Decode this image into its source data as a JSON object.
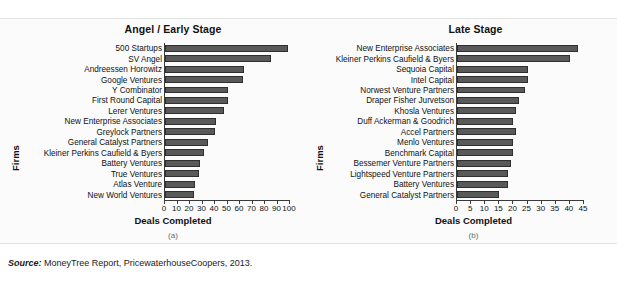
{
  "source": {
    "label": "Source:",
    "text": " MoneyTree Report, PricewaterhouseCoopers, 2013."
  },
  "colors": {
    "bar_fill": "#595959",
    "bar_border": "#2f2f2f",
    "panel_background": "#fbfbfb",
    "axis": "#3a3a3a",
    "text": "#111111"
  },
  "chart_data": [
    {
      "type": "bar",
      "orientation": "horizontal",
      "title": "Angel / Early Stage",
      "caption": "(a)",
      "xlabel": "Deals Completed",
      "ylabel": "Firms",
      "xlim": [
        0,
        100
      ],
      "xticks": [
        "0",
        "10",
        "20",
        "30",
        "40",
        "50",
        "60",
        "70",
        "80",
        "90",
        "100"
      ],
      "grid": false,
      "legend": "none",
      "categories": [
        "500 Startups",
        "SV Angel",
        "Andreessen Horowitz",
        "Google Ventures",
        "Y Combinator",
        "First Round Capital",
        "Lerer Ventures",
        "New Enterprise Associates",
        "Greylock Partners",
        "General Catalyst Partners",
        "Kleiner Perkins Caufield & Byers",
        "Battery Ventures",
        "True Ventures",
        "Atlas Venture",
        "New World Ventures"
      ],
      "values": [
        98,
        85,
        63,
        62,
        50,
        50,
        47,
        41,
        40,
        34,
        31,
        28,
        27,
        24,
        23
      ]
    },
    {
      "type": "bar",
      "orientation": "horizontal",
      "title": "Late Stage",
      "caption": "(b)",
      "xlabel": "Deals Completed",
      "ylabel": "Firms",
      "xlim": [
        0,
        45
      ],
      "xticks": [
        "0",
        "5",
        "10",
        "15",
        "20",
        "25",
        "30",
        "35",
        "40",
        "45"
      ],
      "grid": false,
      "legend": "none",
      "categories": [
        "New Enterprise Associates",
        "Kleiner Perkins Caufield & Byers",
        "Sequoia Capital",
        "Intel Capital",
        "Norwest Venture Partners",
        "Draper Fisher Jurvetson",
        "Khosla Ventures",
        "Duff Ackerman & Goodrich",
        "Accel Partners",
        "Menlo Ventures",
        "Benchmark Capital",
        "Bessemer Venture Partners",
        "Lightspeed Venture Partners",
        "Battery Ventures",
        "General Catalyst Partners"
      ],
      "values": [
        43,
        40,
        25,
        25,
        24,
        22,
        21,
        20,
        21,
        20,
        20,
        19,
        18,
        18,
        15
      ]
    }
  ]
}
